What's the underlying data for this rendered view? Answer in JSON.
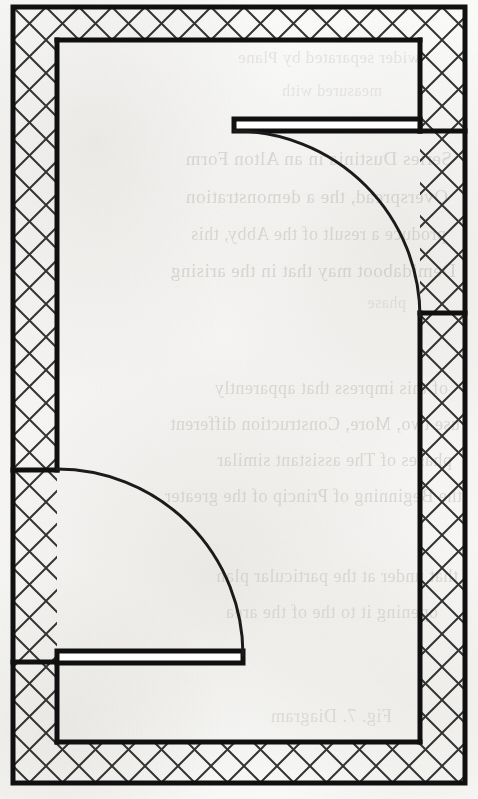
{
  "document": {
    "kind": "architectural-floor-plan",
    "medium": "scanned book page",
    "title": "Floor plan — rectangular room with two swing doors",
    "page_width": 478,
    "page_height": 799,
    "background_color": "#fbfbfa",
    "ink_color": "#111111",
    "hatch_color": "#3a3a3a",
    "bleed_color": "#b9b5ae"
  },
  "plan": {
    "name": "rectangular-room",
    "outer_rect": {
      "x": 13,
      "y": 7,
      "width": 452,
      "height": 776
    },
    "inner_rect": {
      "x": 57,
      "y": 40,
      "width": 363,
      "height": 702
    },
    "wall_thickness_left": 44,
    "wall_thickness_right": 45,
    "wall_thickness_top": 33,
    "wall_thickness_bottom": 41,
    "outline_stroke_width": 5,
    "hatch_pattern": "diagonal-crosshatch",
    "hatch_spacing": 33,
    "hatch_stroke_width": 2
  },
  "walls": [
    {
      "name": "top-wall",
      "orientation": "horizontal",
      "outer": {
        "x1": 13,
        "y1": 7,
        "x2": 465,
        "y2": 7
      },
      "inner": {
        "x1": 57,
        "y1": 40,
        "x2": 420,
        "y2": 40
      },
      "hatched": true
    },
    {
      "name": "left-wall-upper",
      "orientation": "vertical",
      "outer": {
        "x1": 13,
        "y1": 7,
        "x2": 13,
        "y2": 470
      },
      "inner": {
        "x1": 57,
        "y1": 40,
        "x2": 57,
        "y2": 470
      },
      "hatched": true
    },
    {
      "name": "left-wall-lower",
      "orientation": "vertical",
      "outer": {
        "x1": 13,
        "y1": 662,
        "x2": 13,
        "y2": 783
      },
      "inner": {
        "x1": 57,
        "y1": 662,
        "x2": 57,
        "y2": 742
      },
      "hatched": true
    },
    {
      "name": "right-wall-upper",
      "orientation": "vertical",
      "outer": {
        "x1": 465,
        "y1": 7,
        "x2": 465,
        "y2": 131
      },
      "inner": {
        "x1": 420,
        "y1": 40,
        "x2": 420,
        "y2": 131
      },
      "hatched": true
    },
    {
      "name": "right-wall-lower",
      "orientation": "vertical",
      "outer": {
        "x1": 465,
        "y1": 313,
        "x2": 465,
        "y2": 783
      },
      "inner": {
        "x1": 420,
        "y1": 313,
        "x2": 420,
        "y2": 742
      },
      "hatched": true
    },
    {
      "name": "bottom-wall",
      "orientation": "horizontal",
      "outer": {
        "x1": 13,
        "y1": 783,
        "x2": 465,
        "y2": 783
      },
      "inner": {
        "x1": 57,
        "y1": 742,
        "x2": 420,
        "y2": 742
      },
      "hatched": true
    }
  ],
  "doors": [
    {
      "name": "upper-right-door",
      "wall": "right-wall",
      "opening": {
        "x": 420,
        "y1": 131,
        "y2": 313
      },
      "opening_width": 182,
      "hinge": {
        "x": 420,
        "y": 131
      },
      "swing_radius": 186,
      "swing_direction": "counterclockwise-into-room",
      "leaf": {
        "x": 234,
        "y": 119,
        "width": 186,
        "height": 12
      },
      "leaf_orientation": "horizontal",
      "arc_start": {
        "x": 234,
        "y": 131
      },
      "arc_end": {
        "x": 420,
        "y": 317
      }
    },
    {
      "name": "lower-left-door",
      "wall": "left-wall",
      "opening": {
        "x": 57,
        "y1": 470,
        "y2": 662
      },
      "opening_width": 192,
      "hinge": {
        "x": 57,
        "y": 655
      },
      "swing_radius": 186,
      "swing_direction": "clockwise-into-room",
      "leaf": {
        "x": 57,
        "y": 651,
        "width": 186,
        "height": 12
      },
      "leaf_orientation": "horizontal",
      "arc_start": {
        "x": 57,
        "y": 469
      },
      "arc_end": {
        "x": 243,
        "y": 655
      }
    }
  ],
  "bleed_through": {
    "description": "faint mirrored show-through text from the reverse side of the scanned page",
    "mirrored": true,
    "lines": [
      {
        "text": "wider separated by Plane",
        "x": 58,
        "y": 48,
        "size": 17,
        "opacity": 0.3
      },
      {
        "text": "measured with",
        "x": 96,
        "y": 82,
        "size": 16,
        "opacity": 0.28
      },
      {
        "text": "Series Dustinia in an Alton Form",
        "x": 26,
        "y": 148,
        "size": 19,
        "opacity": 0.46
      },
      {
        "text": "Overspread, the a demonstration",
        "x": 30,
        "y": 186,
        "size": 19,
        "opacity": 0.46
      },
      {
        "text": "produce a result of the Abby, this",
        "x": 32,
        "y": 224,
        "size": 18,
        "opacity": 0.44
      },
      {
        "text": "Demidaboot may that in the arising",
        "x": 22,
        "y": 260,
        "size": 19,
        "opacity": 0.47
      },
      {
        "text": "phase",
        "x": 72,
        "y": 294,
        "size": 16,
        "opacity": 0.3
      },
      {
        "text": "of this impress that apparently",
        "x": 30,
        "y": 378,
        "size": 18,
        "opacity": 0.44
      },
      {
        "text": "use two, More, Construction different",
        "x": 18,
        "y": 414,
        "size": 18,
        "opacity": 0.46
      },
      {
        "text": "phases of The assistant similar",
        "x": 26,
        "y": 450,
        "size": 18,
        "opacity": 0.44
      },
      {
        "text": "the Beginning of Princip of the greater",
        "x": 16,
        "y": 486,
        "size": 18,
        "opacity": 0.44
      },
      {
        "text": "that under at the particular plan",
        "x": 20,
        "y": 566,
        "size": 18,
        "opacity": 0.42
      },
      {
        "text": "opening it to the of the area",
        "x": 40,
        "y": 602,
        "size": 18,
        "opacity": 0.4
      },
      {
        "text": "Fig. 7. Diagram",
        "x": 86,
        "y": 706,
        "size": 18,
        "opacity": 0.38
      }
    ]
  }
}
